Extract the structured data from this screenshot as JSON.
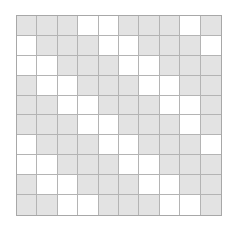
{
  "figure": {
    "type": "grid-pattern",
    "title": "",
    "rows": 10,
    "columns": 10,
    "filled_color": "#e3e3e3",
    "empty_color": "#ffffff",
    "grid_line_color": "#b4b4b4",
    "border_color": "#a8a8a8",
    "background_color": "#ffffff",
    "pattern_description": "Diagonal stripe pattern, period 5: three shaded cells followed by two blank cells, shifting one column to the right each successive row.",
    "legend": {
      "filled_label": "shaded",
      "empty_label": "blank"
    },
    "cells": [
      [
        1,
        1,
        1,
        0,
        0,
        1,
        1,
        1,
        0,
        1
      ],
      [
        0,
        1,
        1,
        1,
        0,
        0,
        1,
        1,
        1,
        0
      ],
      [
        0,
        0,
        1,
        1,
        1,
        0,
        0,
        1,
        1,
        1
      ],
      [
        1,
        0,
        0,
        1,
        1,
        1,
        0,
        0,
        1,
        1
      ],
      [
        1,
        1,
        0,
        0,
        1,
        1,
        1,
        0,
        0,
        1
      ],
      [
        1,
        1,
        1,
        0,
        0,
        1,
        1,
        1,
        0,
        1
      ],
      [
        0,
        1,
        1,
        1,
        0,
        0,
        1,
        1,
        1,
        0
      ],
      [
        0,
        0,
        1,
        1,
        1,
        0,
        0,
        1,
        1,
        1
      ],
      [
        1,
        0,
        0,
        1,
        1,
        1,
        0,
        0,
        1,
        1
      ],
      [
        1,
        1,
        0,
        0,
        1,
        1,
        1,
        0,
        0,
        1
      ]
    ]
  }
}
